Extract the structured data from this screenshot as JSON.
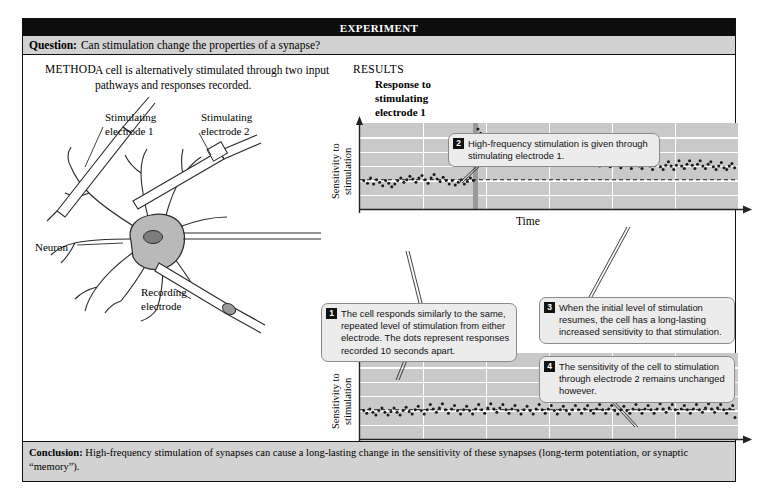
{
  "header": {
    "banner_title": "EXPERIMENT",
    "question_label": "Question:",
    "question_text": "Can stimulation change the properties of a synapse?"
  },
  "method": {
    "label": "METHOD",
    "text": "A cell is alternatively stimulated through two input pathways and responses recorded.",
    "diagram_labels": {
      "stimulating_electrode_1": "Stimulating\nelectrode 1",
      "stimulating_electrode_2": "Stimulating\nelectrode 2",
      "neuron": "Neuron",
      "recording_electrode": "Recording\nelectrode"
    }
  },
  "results": {
    "label": "RESULTS",
    "chart1_title": "Response to\nstimulating\nelectrode 1",
    "chart2_title": "Response to\nstimulating\nelectrode 2",
    "ylabel": "Sensitivity to\nstimulation",
    "xlabel": "Time"
  },
  "callouts": [
    {
      "num": "1",
      "text": "The cell responds similarly to the same, repeated level of stimulation from either electrode. The dots represent responses recorded 10 seconds apart."
    },
    {
      "num": "2",
      "text": "High-frequency stimulation is given through stimulating electrode 1."
    },
    {
      "num": "3",
      "text": "When the initial level of stimulation resumes, the cell has a long-lasting increased sensitivity to that stimulation."
    },
    {
      "num": "4",
      "text": "The sensitivity of the cell to stimulation through electrode 2 remains unchanged however."
    }
  ],
  "conclusion": {
    "label": "Conclusion:",
    "text": "High-frequency stimulation of synapses can cause a long-lasting change in the sensitivity of these synapses (long-term potentiation, or synaptic “memory”)."
  },
  "colors": {
    "banner_bg": "#0d0d0d",
    "bar_bg": "#d2d2d2",
    "plot_bg": "#c9c9c9",
    "gridline": "#ffffff",
    "dot": "#1b1b1b",
    "stim_band": "#9a9a9a",
    "callout_bg": "#ececec"
  },
  "chart_data": [
    {
      "type": "scatter",
      "title": "Response to stimulating electrode 1",
      "xlabel": "Time",
      "ylabel": "Sensitivity to stimulation",
      "xlim": [
        0,
        100
      ],
      "ylim": [
        0,
        100
      ],
      "grid": true,
      "baseline_y": 34,
      "baseline_style": "dashed",
      "stimulus_marker": {
        "x": 30.5,
        "label": "high-frequency stimulation",
        "style": "vertical-band"
      },
      "points": [
        [
          1.0,
          33
        ],
        [
          2.0,
          30
        ],
        [
          2.8,
          36
        ],
        [
          3.6,
          29
        ],
        [
          4.4,
          34
        ],
        [
          5.2,
          31
        ],
        [
          6.0,
          27
        ],
        [
          6.8,
          33
        ],
        [
          7.6,
          30
        ],
        [
          8.4,
          26
        ],
        [
          9.2,
          29
        ],
        [
          10.0,
          33
        ],
        [
          10.8,
          36
        ],
        [
          11.6,
          31
        ],
        [
          12.4,
          34
        ],
        [
          13.2,
          38
        ],
        [
          14.0,
          35
        ],
        [
          14.8,
          31
        ],
        [
          15.6,
          36
        ],
        [
          16.4,
          39
        ],
        [
          17.2,
          34
        ],
        [
          18.0,
          30
        ],
        [
          18.8,
          36
        ],
        [
          19.6,
          40
        ],
        [
          20.4,
          35
        ],
        [
          21.2,
          32
        ],
        [
          22.0,
          37
        ],
        [
          22.8,
          33
        ],
        [
          23.6,
          29
        ],
        [
          24.4,
          33
        ],
        [
          25.2,
          28
        ],
        [
          26.0,
          31
        ],
        [
          26.8,
          34
        ],
        [
          27.6,
          29
        ],
        [
          28.4,
          32
        ],
        [
          29.2,
          36
        ],
        [
          30.0,
          33
        ],
        [
          31.2,
          93
        ],
        [
          31.9,
          88
        ],
        [
          32.6,
          83
        ],
        [
          33.3,
          86
        ],
        [
          34.0,
          79
        ],
        [
          34.7,
          82
        ],
        [
          35.4,
          76
        ],
        [
          36.1,
          79
        ],
        [
          36.8,
          73
        ],
        [
          37.5,
          76
        ],
        [
          38.2,
          70
        ],
        [
          38.9,
          74
        ],
        [
          39.6,
          68
        ],
        [
          40.3,
          72
        ],
        [
          41.0,
          66
        ],
        [
          41.7,
          70
        ],
        [
          42.4,
          64
        ],
        [
          43.1,
          68
        ],
        [
          43.8,
          73
        ],
        [
          44.5,
          66
        ],
        [
          45.2,
          62
        ],
        [
          45.9,
          67
        ],
        [
          46.6,
          61
        ],
        [
          47.3,
          65
        ],
        [
          48.0,
          70
        ],
        [
          48.7,
          63
        ],
        [
          49.4,
          58
        ],
        [
          50.1,
          62
        ],
        [
          50.8,
          67
        ],
        [
          51.5,
          60
        ],
        [
          52.2,
          56
        ],
        [
          52.9,
          61
        ],
        [
          53.6,
          65
        ],
        [
          54.3,
          58
        ],
        [
          55.0,
          54
        ],
        [
          55.7,
          59
        ],
        [
          56.4,
          63
        ],
        [
          57.1,
          56
        ],
        [
          57.8,
          52
        ],
        [
          58.5,
          57
        ],
        [
          59.2,
          61
        ],
        [
          59.9,
          55
        ],
        [
          60.6,
          51
        ],
        [
          61.3,
          56
        ],
        [
          62.0,
          60
        ],
        [
          62.7,
          54
        ],
        [
          63.4,
          50
        ],
        [
          64.1,
          55
        ],
        [
          64.8,
          59
        ],
        [
          65.5,
          53
        ],
        [
          66.2,
          49
        ],
        [
          66.9,
          54
        ],
        [
          67.6,
          58
        ],
        [
          68.3,
          52
        ],
        [
          69.0,
          48
        ],
        [
          69.7,
          53
        ],
        [
          70.4,
          57
        ],
        [
          71.1,
          51
        ],
        [
          71.8,
          47
        ],
        [
          72.5,
          52
        ],
        [
          73.2,
          56
        ],
        [
          73.9,
          50
        ],
        [
          74.6,
          47
        ],
        [
          75.3,
          52
        ],
        [
          76.0,
          56
        ],
        [
          76.7,
          50
        ],
        [
          77.4,
          46
        ],
        [
          78.1,
          51
        ],
        [
          78.8,
          55
        ],
        [
          79.5,
          49
        ],
        [
          80.2,
          46
        ],
        [
          80.9,
          51
        ],
        [
          81.6,
          55
        ],
        [
          82.3,
          50
        ],
        [
          83.0,
          46
        ],
        [
          83.7,
          51
        ],
        [
          84.4,
          56
        ],
        [
          85.1,
          50
        ],
        [
          85.8,
          47
        ],
        [
          86.5,
          52
        ],
        [
          87.2,
          56
        ],
        [
          87.9,
          51
        ],
        [
          88.6,
          47
        ],
        [
          89.3,
          52
        ],
        [
          90.0,
          56
        ],
        [
          90.7,
          50
        ],
        [
          91.4,
          47
        ],
        [
          92.1,
          52
        ],
        [
          92.8,
          55
        ],
        [
          93.5,
          49
        ],
        [
          94.2,
          46
        ],
        [
          94.9,
          50
        ],
        [
          95.6,
          54
        ],
        [
          96.3,
          48
        ],
        [
          97.0,
          46
        ],
        [
          97.7,
          50
        ],
        [
          98.4,
          53
        ],
        [
          99.1,
          48
        ]
      ]
    },
    {
      "type": "scatter",
      "title": "Response to stimulating electrode 2",
      "xlabel": "Time",
      "ylabel": "Sensitivity to stimulation",
      "xlim": [
        0,
        100
      ],
      "ylim": [
        0,
        100
      ],
      "grid": true,
      "baseline_y": 34,
      "baseline_style": "dashed",
      "stimulus_marker": null,
      "points": [
        [
          1.0,
          33
        ],
        [
          1.8,
          30
        ],
        [
          2.6,
          35
        ],
        [
          3.4,
          31
        ],
        [
          4.2,
          28
        ],
        [
          5.0,
          33
        ],
        [
          5.8,
          36
        ],
        [
          6.6,
          31
        ],
        [
          7.4,
          28
        ],
        [
          8.2,
          32
        ],
        [
          9.0,
          36
        ],
        [
          9.8,
          31
        ],
        [
          10.6,
          28
        ],
        [
          11.4,
          33
        ],
        [
          12.2,
          37
        ],
        [
          13.0,
          32
        ],
        [
          13.8,
          29
        ],
        [
          14.6,
          34
        ],
        [
          15.4,
          38
        ],
        [
          16.2,
          33
        ],
        [
          17.0,
          29
        ],
        [
          17.8,
          34
        ],
        [
          18.6,
          40
        ],
        [
          19.4,
          35
        ],
        [
          20.2,
          31
        ],
        [
          21.0,
          36
        ],
        [
          21.8,
          41
        ],
        [
          22.6,
          34
        ],
        [
          23.4,
          30
        ],
        [
          24.2,
          35
        ],
        [
          25.0,
          39
        ],
        [
          25.8,
          33
        ],
        [
          26.6,
          29
        ],
        [
          27.4,
          34
        ],
        [
          28.2,
          38
        ],
        [
          29.0,
          33
        ],
        [
          29.8,
          29
        ],
        [
          30.6,
          35
        ],
        [
          31.4,
          40
        ],
        [
          32.2,
          34
        ],
        [
          33.0,
          30
        ],
        [
          33.8,
          36
        ],
        [
          34.6,
          41
        ],
        [
          35.4,
          35
        ],
        [
          36.2,
          31
        ],
        [
          37.0,
          36
        ],
        [
          37.8,
          40
        ],
        [
          38.6,
          34
        ],
        [
          39.4,
          30
        ],
        [
          40.2,
          35
        ],
        [
          41.0,
          39
        ],
        [
          41.8,
          33
        ],
        [
          42.6,
          29
        ],
        [
          43.4,
          34
        ],
        [
          44.2,
          38
        ],
        [
          45.0,
          33
        ],
        [
          45.8,
          29
        ],
        [
          46.6,
          35
        ],
        [
          47.4,
          40
        ],
        [
          48.2,
          34
        ],
        [
          49.0,
          30
        ],
        [
          49.8,
          35
        ],
        [
          50.6,
          39
        ],
        [
          51.4,
          33
        ],
        [
          52.2,
          29
        ],
        [
          53.0,
          34
        ],
        [
          53.8,
          38
        ],
        [
          54.6,
          33
        ],
        [
          55.4,
          29
        ],
        [
          56.2,
          34
        ],
        [
          57.0,
          39
        ],
        [
          57.8,
          34
        ],
        [
          58.6,
          30
        ],
        [
          59.4,
          35
        ],
        [
          60.2,
          39
        ],
        [
          61.0,
          33
        ],
        [
          61.8,
          30
        ],
        [
          62.6,
          35
        ],
        [
          63.4,
          40
        ],
        [
          64.2,
          34
        ],
        [
          65.0,
          30
        ],
        [
          65.8,
          35
        ],
        [
          66.6,
          39
        ],
        [
          67.4,
          33
        ],
        [
          68.2,
          29
        ],
        [
          69.0,
          34
        ],
        [
          69.8,
          38
        ],
        [
          70.6,
          33
        ],
        [
          71.4,
          30
        ],
        [
          72.2,
          35
        ],
        [
          73.0,
          40
        ],
        [
          73.8,
          34
        ],
        [
          74.6,
          30
        ],
        [
          75.4,
          35
        ],
        [
          76.2,
          39
        ],
        [
          77.0,
          34
        ],
        [
          77.8,
          30
        ],
        [
          78.6,
          35
        ],
        [
          79.4,
          41
        ],
        [
          80.2,
          35
        ],
        [
          81.0,
          31
        ],
        [
          81.8,
          36
        ],
        [
          82.6,
          40
        ],
        [
          83.4,
          34
        ],
        [
          84.2,
          30
        ],
        [
          85.0,
          35
        ],
        [
          85.8,
          39
        ],
        [
          86.6,
          34
        ],
        [
          87.4,
          30
        ],
        [
          88.2,
          35
        ],
        [
          89.0,
          40
        ],
        [
          89.8,
          34
        ],
        [
          90.6,
          31
        ],
        [
          91.4,
          36
        ],
        [
          92.2,
          41
        ],
        [
          93.0,
          35
        ],
        [
          93.8,
          31
        ],
        [
          94.6,
          36
        ],
        [
          95.4,
          40
        ],
        [
          96.2,
          34
        ],
        [
          97.0,
          30
        ],
        [
          97.8,
          35
        ],
        [
          98.6,
          39
        ],
        [
          99.2,
          25
        ]
      ]
    }
  ]
}
